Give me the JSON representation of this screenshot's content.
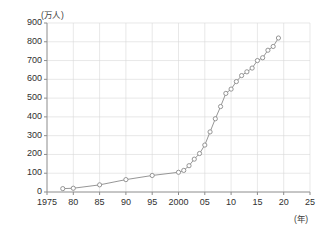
{
  "chart_data": {
    "type": "line",
    "title": "",
    "subtitle": "",
    "xlabel": "(年)",
    "ylabel": "(万人)",
    "xlim": [
      1975,
      2025
    ],
    "ylim": [
      0,
      900
    ],
    "y_ticks": [
      0,
      100,
      200,
      300,
      400,
      500,
      600,
      700,
      800,
      900
    ],
    "y_tick_labels": [
      "0",
      "100",
      "200",
      "300",
      "400",
      "500",
      "600",
      "700",
      "800",
      "900"
    ],
    "x_ticks": [
      1975,
      1980,
      1985,
      1990,
      1995,
      2000,
      2005,
      2010,
      2015,
      2020,
      2025
    ],
    "x_tick_labels": [
      "1975",
      "80",
      "85",
      "90",
      "95",
      "2000",
      "05",
      "10",
      "15",
      "20",
      "25"
    ],
    "grid": true,
    "legend": "none",
    "marker": "open-circle",
    "line_color": "#8a8a8a",
    "marker_color": "#8a8a8a",
    "axis_color": "#8c8c8c",
    "grid_color": "#d8d8d8",
    "series": [
      {
        "name": "在留外国人数",
        "x": [
          1978,
          1980,
          1985,
          1990,
          1995,
          2000,
          2001,
          2002,
          2003,
          2004,
          2005,
          2006,
          2007,
          2008,
          2009,
          2010,
          2011,
          2012,
          2013,
          2014,
          2015,
          2016,
          2017,
          2018,
          2019
        ],
        "values": [
          18,
          20,
          38,
          66,
          88,
          105,
          115,
          140,
          175,
          205,
          250,
          320,
          390,
          455,
          525,
          548,
          588,
          620,
          640,
          660,
          700,
          715,
          755,
          775,
          820
        ]
      }
    ]
  },
  "axes": {
    "y_unit_label": "(万人)",
    "x_unit_label": "(年)"
  }
}
